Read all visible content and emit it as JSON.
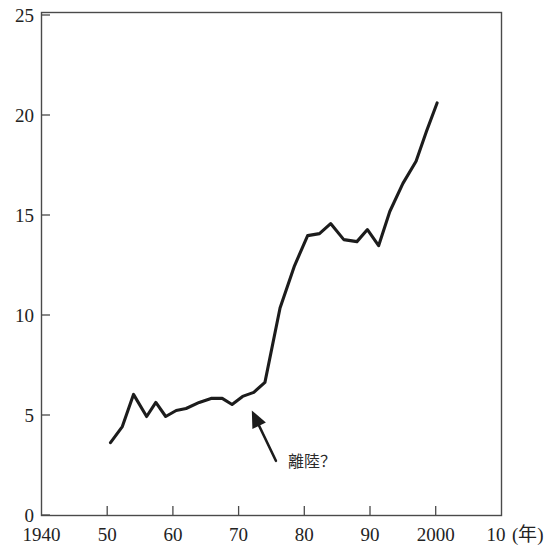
{
  "chart_data": {
    "type": "line",
    "title": "",
    "subtitle": "",
    "xlabel": "(年)",
    "ylabel": "",
    "xlim": [
      1940,
      2010
    ],
    "ylim": [
      0,
      25
    ],
    "grid": false,
    "legend": null,
    "x_tick_labels": [
      "1940",
      "50",
      "60",
      "70",
      "80",
      "90",
      "2000",
      "10"
    ],
    "x_tick_values": [
      1940,
      1950,
      1960,
      1970,
      1980,
      1990,
      2000,
      2010
    ],
    "y_tick_labels": [
      "0",
      "5",
      "10",
      "15",
      "20",
      "25"
    ],
    "y_tick_values": [
      0,
      5,
      10,
      15,
      20,
      25
    ],
    "x_unit_suffix": "(年)",
    "series": [
      {
        "name": "series-1",
        "color": "#1c1c1c",
        "x": [
          1950.5,
          1952.3,
          1954.0,
          1956.0,
          1957.4,
          1958.9,
          1960.5,
          1962.0,
          1964.0,
          1965.8,
          1967.5,
          1969.0,
          1970.6,
          1972.3,
          1974.0,
          1976.3,
          1978.5,
          1980.5,
          1982.3,
          1984.0,
          1986.0,
          1988.0,
          1989.6,
          1991.3,
          1993.0,
          1995.0,
          1997.0,
          1998.6,
          2000.2
        ],
        "y": [
          3.6,
          4.4,
          6.0,
          4.9,
          5.6,
          4.9,
          5.2,
          5.3,
          5.6,
          5.8,
          5.8,
          5.5,
          5.9,
          6.1,
          6.6,
          10.3,
          12.4,
          13.9,
          14.0,
          14.5,
          13.7,
          13.6,
          14.2,
          13.4,
          15.1,
          16.5,
          17.6,
          19.1,
          20.5
        ]
      }
    ],
    "annotations": [
      {
        "text": "離陸？",
        "kind": "arrow-label",
        "points_to_x": 1972.0,
        "points_to_y": 6.4,
        "label_x": 1977.5,
        "label_y": 2.4
      }
    ]
  },
  "axes": {
    "frame_color": "#4a4a4a",
    "line_color": "#1c1c1c"
  }
}
